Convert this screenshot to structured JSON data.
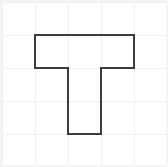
{
  "figure": {
    "canvas": {
      "width": 168,
      "height": 167
    },
    "background_color": "#ffffff",
    "border": {
      "visible": true,
      "color": "#f4f4f4",
      "width": 2,
      "inset": 1
    },
    "grid": {
      "visible": true,
      "color": "#f0f0f0",
      "line_width": 1,
      "cell_size": 33,
      "columns": 5,
      "rows": 5,
      "origin_x": 2,
      "origin_y": 2,
      "vertical_lines_x": [
        2,
        35,
        68,
        101,
        134,
        167
      ],
      "horizontal_lines_y": [
        2,
        35,
        68,
        101,
        134,
        167
      ]
    },
    "shape": {
      "name": "t-shape",
      "type": "polygon",
      "stroke_color": "#3c3c3c",
      "stroke_width": 2,
      "fill": "none",
      "closed": true,
      "vertex_count": 8,
      "points": [
        {
          "x": 35,
          "y": 35
        },
        {
          "x": 134,
          "y": 35
        },
        {
          "x": 134,
          "y": 68
        },
        {
          "x": 101,
          "y": 68
        },
        {
          "x": 101,
          "y": 134
        },
        {
          "x": 68,
          "y": 134
        },
        {
          "x": 68,
          "y": 68
        },
        {
          "x": 35,
          "y": 68
        }
      ],
      "points_attr": "35,35 134,35 134,68 101,68 101,134 68,134 68,68 35,68",
      "grid_cells_covered": 5,
      "parts": {
        "top_bar": {
          "x": 35,
          "y": 35,
          "width": 99,
          "height": 33,
          "cells": 3
        },
        "stem": {
          "x": 68,
          "y": 68,
          "width": 33,
          "height": 66,
          "cells": 2
        }
      }
    }
  }
}
